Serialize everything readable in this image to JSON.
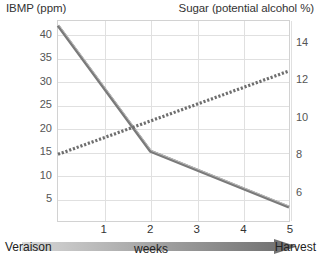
{
  "chart_data": {
    "type": "line",
    "title": "",
    "xlabel": "weeks",
    "x": [
      0,
      1,
      2,
      3,
      4,
      5
    ],
    "xlim": [
      0,
      5
    ],
    "xticks": [
      "1",
      "2",
      "3",
      "4",
      "5"
    ],
    "xtick_values": [
      1,
      2,
      3,
      4,
      5
    ],
    "x_start_label": "Veraison",
    "x_end_label": "Harvest",
    "grid": true,
    "legend": "none",
    "axes": [
      {
        "id": "left",
        "label": "IBMP (ppm)",
        "ylim": [
          0,
          43
        ],
        "yticks": [
          "5",
          "10",
          "15",
          "20",
          "25",
          "30",
          "35",
          "40"
        ],
        "ytick_values": [
          5,
          10,
          15,
          20,
          25,
          30,
          35,
          40
        ]
      },
      {
        "id": "right",
        "label": "Sugar (potential alcohol %)",
        "ylim": [
          4.4,
          15.2
        ],
        "yticks": [
          "6",
          "8",
          "10",
          "12",
          "14"
        ],
        "ytick_values": [
          6,
          8,
          10,
          12,
          14
        ]
      }
    ],
    "series": [
      {
        "name": "IBMP (ppm)",
        "axis": "left",
        "style": "solid",
        "color": "#7a7a7a",
        "x": [
          0,
          2,
          5
        ],
        "values": [
          42,
          15,
          3
        ]
      },
      {
        "name": "Sugar (potential alcohol %)",
        "axis": "right",
        "style": "dashed",
        "color": "#6e6e6e",
        "x": [
          0,
          5
        ],
        "values": [
          8,
          12.5
        ]
      }
    ]
  },
  "labels": {
    "left_axis_title": "IBMP (ppm)",
    "right_axis_title": "Sugar (potential alcohol %)",
    "x_axis_title": "weeks",
    "x_start": "Veraison",
    "x_end": "Harvest"
  },
  "colors": {
    "ibmp_line": "#7a7a7a",
    "sugar_line": "#6e6e6e",
    "gridline": "#e0e0e0",
    "plot_border": "#d2d2d2",
    "arrow_light": "#d8d8d8",
    "arrow_dark": "#6b6b6b",
    "text": "#333333",
    "background": "#ffffff"
  }
}
